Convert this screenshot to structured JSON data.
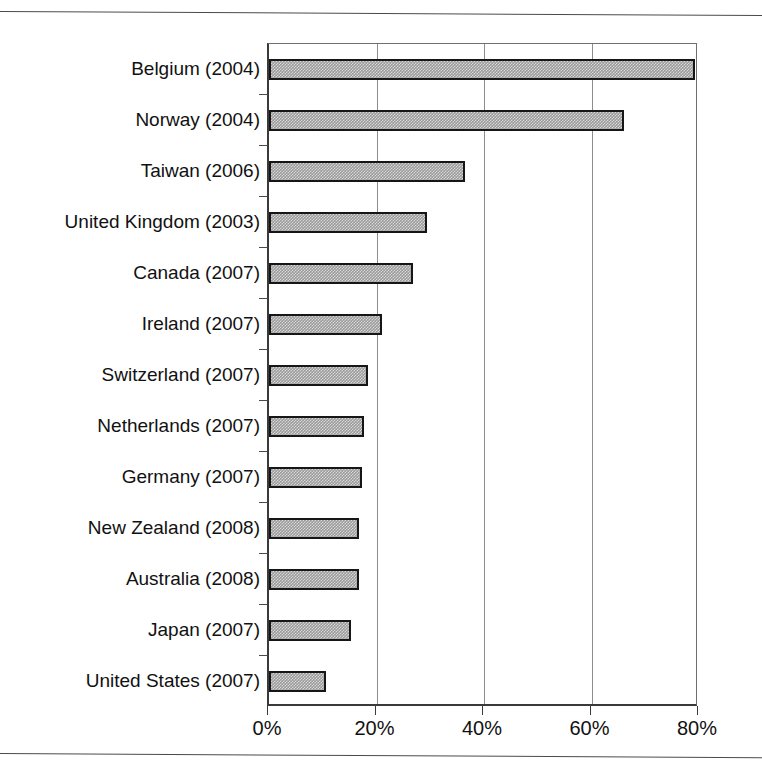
{
  "chart_data": {
    "type": "bar",
    "orientation": "horizontal",
    "title": "",
    "subtitle": "",
    "xlabel": "",
    "ylabel": "",
    "xlim": [
      0,
      80
    ],
    "xticks": [
      0,
      20,
      40,
      60,
      80
    ],
    "xticklabels": [
      "0%",
      "20%",
      "40%",
      "60%",
      "80%"
    ],
    "grid": "vertical",
    "legend": null,
    "categories": [
      "Belgium (2004)",
      "Norway (2004)",
      "Taiwan (2006)",
      "United Kingdom (2003)",
      "Canada (2007)",
      "Ireland (2007)",
      "Switzerland (2007)",
      "Netherlands (2007)",
      "Germany (2007)",
      "New Zealand (2008)",
      "Australia (2008)",
      "Japan (2007)",
      "United States (2007)"
    ],
    "values": [
      79.3,
      66.0,
      36.5,
      29.4,
      26.8,
      21.0,
      18.4,
      17.7,
      17.3,
      16.8,
      16.8,
      15.3,
      10.6
    ],
    "series": [
      {
        "name": "",
        "values": [
          79.3,
          66.0,
          36.5,
          29.4,
          26.8,
          21.0,
          18.4,
          17.7,
          17.3,
          16.8,
          16.8,
          15.3,
          10.6
        ]
      }
    ],
    "bar_color": "#9b9b9b",
    "bar_edge_color": "#161616",
    "axis_color": "#3a3a3a",
    "gridline_color": "#8d8d8d",
    "background_color": "#ffffff"
  },
  "page": {
    "rule_color": "#4a4a4a"
  }
}
